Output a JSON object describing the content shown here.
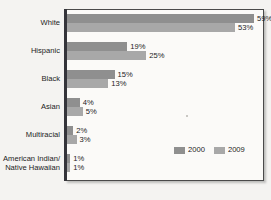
{
  "chart_data": {
    "type": "bar",
    "orientation": "horizontal",
    "title": "",
    "subtitle": "",
    "xlabel": "",
    "ylabel": "",
    "grid": false,
    "legend_position": "inside-bottom-right",
    "xlim": [
      0,
      62
    ],
    "categories": [
      "White",
      "Hispanic",
      "Black",
      "Asian",
      "Multiracial",
      "American Indian/ Native Hawaiian"
    ],
    "category_lines": [
      [
        "White"
      ],
      [
        "Hispanic"
      ],
      [
        "Black"
      ],
      [
        "Asian"
      ],
      [
        "Multiracial"
      ],
      [
        "American Indian/",
        "Native Hawaiian"
      ]
    ],
    "series": [
      {
        "name": "2000",
        "color": "#8f8f8f",
        "values": [
          59,
          19,
          15,
          4,
          2,
          1
        ],
        "labels": [
          "59%",
          "19%",
          "15%",
          "4%",
          "2%",
          "1%"
        ]
      },
      {
        "name": "2009",
        "color": "#a8a8a8",
        "values": [
          53,
          25,
          13,
          5,
          3,
          1
        ],
        "labels": [
          "53%",
          "25%",
          "13%",
          "5%",
          "3%",
          "1%"
        ]
      }
    ]
  },
  "legend": {
    "items": [
      {
        "label": "2000",
        "color": "#8f8f8f"
      },
      {
        "label": "2009",
        "color": "#a8a8a8"
      }
    ]
  },
  "colors": {
    "series_2000": "#8f8f8f",
    "series_2009": "#a8a8a8",
    "axis": "#34343a",
    "plot_background": "#fbfaf8",
    "page_background": "#f4f3f1",
    "text": "#1c1c1c"
  }
}
